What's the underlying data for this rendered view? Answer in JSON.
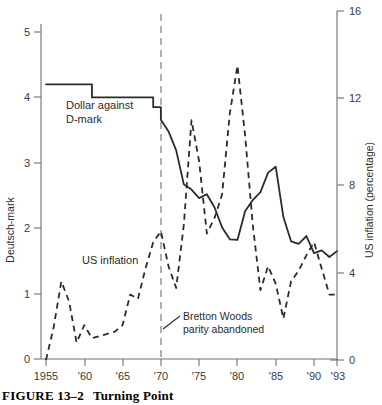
{
  "figure": {
    "caption_number": "FIGURE 13–2",
    "caption_title": "Turning Point"
  },
  "axes": {
    "left_title": "Deutsch-mark",
    "right_title": "US inflation (percentage)",
    "left_ticks": [
      "0",
      "1",
      "2",
      "3",
      "4",
      "5"
    ],
    "right_ticks": [
      "0",
      "4",
      "8",
      "12",
      "16"
    ],
    "x_ticks": [
      "1955",
      "'60",
      "'65",
      "'70",
      "'75",
      "'80",
      "'85",
      "'90",
      "'93"
    ]
  },
  "labels": {
    "dollar_series": "Dollar against",
    "dollar_series_line2": "D-mark",
    "inflation_series": "US inflation",
    "annotation_line1": "Bretton Woods",
    "annotation_line2": "parity abandoned"
  },
  "colors": {
    "line": "#2b2b2b",
    "axis": "#6f6f6f",
    "background": "#ffffff"
  },
  "chart_data": {
    "type": "line",
    "title": "Turning Point",
    "xlabel": "",
    "ylabel": "Deutsch-mark",
    "y2label": "US inflation (percentage)",
    "xlim": [
      1955,
      1993
    ],
    "ylim": [
      0,
      5
    ],
    "y2lim": [
      0,
      16
    ],
    "grid": false,
    "legend": "inline-annotations",
    "annotations": [
      {
        "text": "Bretton Woods parity abandoned",
        "x": 1970,
        "note": "vertical dashed reference line at 1970"
      }
    ],
    "series": [
      {
        "name": "Dollar against D-mark",
        "axis": "left",
        "style": "solid",
        "units": "DM per USD",
        "x": [
          1955,
          1961,
          1961,
          1969,
          1969,
          1970,
          1970,
          1971,
          1972,
          1973,
          1974,
          1975,
          1976,
          1977,
          1978,
          1979,
          1980,
          1981,
          1982,
          1983,
          1984,
          1985,
          1986,
          1987,
          1988,
          1989,
          1990,
          1991,
          1992,
          1993
        ],
        "y": [
          4.2,
          4.2,
          4.0,
          4.0,
          3.85,
          3.85,
          3.66,
          3.48,
          3.19,
          2.67,
          2.59,
          2.46,
          2.52,
          2.32,
          2.01,
          1.83,
          1.82,
          2.26,
          2.43,
          2.55,
          2.85,
          2.94,
          2.17,
          1.8,
          1.76,
          1.88,
          1.62,
          1.66,
          1.56,
          1.65
        ]
      },
      {
        "name": "US inflation",
        "axis": "right",
        "style": "dashed",
        "units": "percent",
        "x": [
          1955,
          1956,
          1957,
          1958,
          1959,
          1960,
          1961,
          1962,
          1963,
          1964,
          1965,
          1966,
          1967,
          1968,
          1969,
          1970,
          1971,
          1972,
          1973,
          1974,
          1975,
          1976,
          1977,
          1978,
          1979,
          1980,
          1981,
          1982,
          1983,
          1984,
          1985,
          1986,
          1987,
          1988,
          1989,
          1990,
          1991,
          1992,
          1993
        ],
        "y": [
          -0.4,
          1.5,
          3.6,
          2.7,
          0.8,
          1.6,
          1.0,
          1.1,
          1.2,
          1.3,
          1.6,
          3.0,
          2.8,
          4.2,
          5.4,
          5.9,
          4.3,
          3.3,
          6.2,
          11.0,
          9.1,
          5.8,
          6.5,
          7.6,
          11.3,
          13.5,
          10.3,
          6.2,
          3.2,
          4.3,
          3.5,
          1.9,
          3.6,
          4.1,
          4.8,
          5.4,
          4.2,
          3.0,
          3.0
        ]
      }
    ]
  }
}
